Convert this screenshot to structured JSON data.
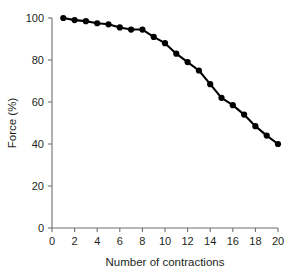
{
  "chart_data": {
    "type": "line",
    "title": "",
    "xlabel": "Number of contractions",
    "ylabel": "Force (%)",
    "xlim": [
      0,
      20
    ],
    "ylim": [
      0,
      100
    ],
    "xticks": [
      0,
      2,
      4,
      6,
      8,
      10,
      12,
      14,
      16,
      18,
      20
    ],
    "yticks": [
      0,
      20,
      40,
      60,
      80,
      100
    ],
    "xtick_labels": [
      "0",
      "2",
      "4",
      "6",
      "8",
      "10",
      "12",
      "14",
      "16",
      "18",
      "20"
    ],
    "ytick_labels": [
      "0",
      "20",
      "40",
      "60",
      "80",
      "100"
    ],
    "grid": false,
    "legend": false,
    "marker": "filled-circle",
    "line_color": "#000000",
    "marker_color": "#000000",
    "axis_color": "#6f6f6f",
    "background": "#ffffff",
    "series": [
      {
        "name": "Force",
        "x": [
          1,
          2,
          3,
          4,
          5,
          6,
          7,
          8,
          9,
          10,
          11,
          12,
          13,
          14,
          15,
          16,
          17,
          18,
          19,
          20
        ],
        "values": [
          100,
          99,
          98.5,
          97.5,
          97,
          95.5,
          94.5,
          94.5,
          91,
          88,
          83,
          79,
          75,
          68.5,
          62,
          58.5,
          54,
          48.5,
          44,
          40
        ]
      }
    ]
  }
}
